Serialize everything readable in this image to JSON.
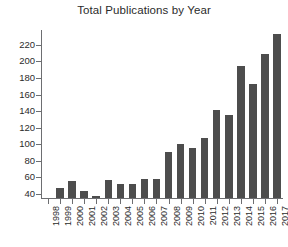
{
  "chart_data": {
    "type": "bar",
    "title": "Total Publications by Year",
    "xlabel": "",
    "ylabel": "",
    "categories": [
      "1998",
      "1999",
      "2000",
      "2001",
      "2002",
      "2003",
      "2004",
      "2005",
      "2006",
      "2007",
      "2008",
      "2009",
      "2010",
      "2011",
      "2012",
      "2013",
      "2014",
      "2015",
      "2016",
      "2017"
    ],
    "values": [
      0,
      47,
      55,
      43,
      38,
      57,
      52,
      52,
      58,
      58,
      90,
      100,
      95,
      107,
      141,
      135,
      194,
      173,
      209,
      233
    ],
    "ylim": [
      35,
      238
    ],
    "yticks": [
      40,
      60,
      80,
      100,
      120,
      140,
      160,
      180,
      200,
      220
    ],
    "ytick_labels": [
      "40",
      "60",
      "80",
      "100",
      "120",
      "140",
      "160",
      "180",
      "200",
      "220"
    ],
    "grid": false,
    "legend": false,
    "bar_color": "#4d4d4d",
    "axis_color": "#6d6e71",
    "background_color": "#ffffff",
    "text_color": "#2b2b2b",
    "baseline_value": 35,
    "xtick_rotation": -90
  }
}
